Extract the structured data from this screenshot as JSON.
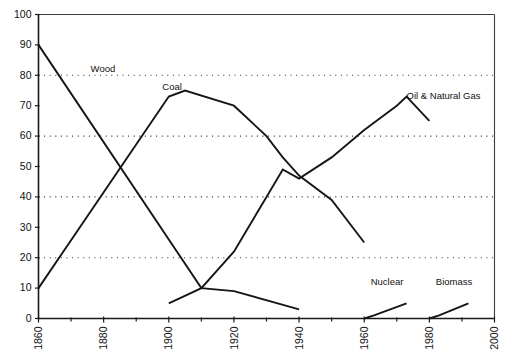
{
  "chart_data": {
    "type": "line",
    "title": "",
    "subtitle": "",
    "xlabel": "",
    "ylabel": "",
    "xlim": [
      1860,
      2000
    ],
    "ylim": [
      0,
      100
    ],
    "grid": "horizontal dotted gridlines at 20, 40, 60, 80, 100",
    "legend_position": "inline labels next to each series",
    "x_ticks_major": [
      1860,
      1880,
      1900,
      1920,
      1940,
      1960,
      1980,
      2000
    ],
    "x_ticks_minor_step": 10,
    "x_tick_labels": [
      "1860",
      "1880",
      "1900",
      "1920",
      "1940",
      "1960",
      "1980",
      "2000"
    ],
    "y_ticks": [
      0,
      10,
      20,
      30,
      40,
      50,
      60,
      70,
      80,
      90,
      100
    ],
    "y_tick_labels": [
      "0",
      "10",
      "20",
      "30",
      "40",
      "50",
      "60",
      "70",
      "80",
      "90",
      "100"
    ],
    "gridline_values": [
      20,
      40,
      60,
      80,
      100
    ],
    "series": [
      {
        "name": "Wood",
        "label": "Wood",
        "label_x": 1876,
        "label_y": 82,
        "x": [
          1860,
          1910,
          1920,
          1940
        ],
        "values": [
          90,
          10,
          9,
          3
        ]
      },
      {
        "name": "Coal",
        "label": "Coal",
        "label_x": 1898,
        "label_y": 76,
        "x": [
          1860,
          1900,
          1905,
          1920,
          1930,
          1935,
          1940,
          1950,
          1960
        ],
        "values": [
          10,
          73,
          75,
          70,
          60,
          53,
          47,
          39,
          25
        ]
      },
      {
        "name": "Oil & Natural Gas",
        "label": "Oil & Natural Gas",
        "label_x": 1973,
        "label_y": 73,
        "x": [
          1900,
          1910,
          1920,
          1930,
          1935,
          1940,
          1950,
          1960,
          1970,
          1973,
          1980
        ],
        "values": [
          5,
          10,
          22,
          40,
          49,
          46,
          53,
          62,
          70,
          73,
          65
        ]
      },
      {
        "name": "Nuclear",
        "label": "Nuclear",
        "label_x": 1962,
        "label_y": 12,
        "x": [
          1960,
          1963,
          1973
        ],
        "values": [
          0,
          1,
          5
        ]
      },
      {
        "name": "Biomass",
        "label": "Biomass",
        "label_x": 1982,
        "label_y": 12,
        "x": [
          1980,
          1983,
          1992
        ],
        "values": [
          0,
          1,
          5
        ]
      }
    ]
  }
}
